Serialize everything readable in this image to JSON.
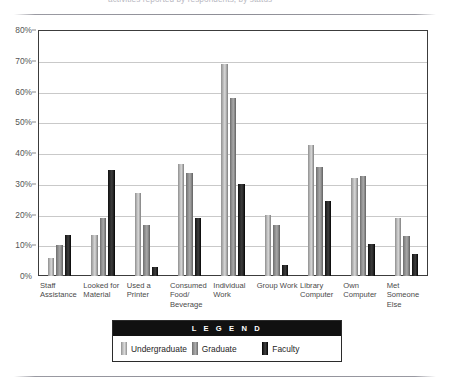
{
  "caption": {
    "text": "activities reported by respondents, by status"
  },
  "legend": {
    "title": "L E G E N D",
    "entries": [
      {
        "label": "Undergraduate",
        "key": "undergrad",
        "color": "#bdbdbd",
        "swatch_icon": "legend-swatch-undergraduate"
      },
      {
        "label": "Graduate",
        "key": "graduate",
        "color": "#949494",
        "swatch_icon": "legend-swatch-graduate"
      },
      {
        "label": "Faculty",
        "key": "faculty",
        "color": "#111111",
        "swatch_icon": "legend-swatch-faculty"
      }
    ]
  },
  "chart_data": {
    "type": "bar",
    "title": "",
    "xlabel": "",
    "ylabel": "",
    "ylim": [
      0,
      80
    ],
    "ytick_step": 10,
    "ytick_labels": [
      "0%",
      "10%",
      "20%",
      "30%",
      "40%",
      "50%",
      "60%",
      "70%",
      "80%"
    ],
    "grid": true,
    "legend_position": "bottom",
    "value_unit": "%",
    "categories": [
      "Staff Assistance",
      "Looked for Material",
      "Used a Printer",
      "Consumed Food/ Beverage",
      "Individual Work",
      "Group Work",
      "Library Computer",
      "Own Computer",
      "Met Someone Else"
    ],
    "series": [
      {
        "name": "Undergraduate",
        "color": "#bdbdbd",
        "values": [
          6,
          13.5,
          27,
          36.5,
          69,
          20,
          42.5,
          32,
          19
        ]
      },
      {
        "name": "Graduate",
        "color": "#949494",
        "values": [
          10,
          19,
          16.5,
          33.5,
          58,
          16.5,
          35.5,
          32.5,
          13
        ]
      },
      {
        "name": "Faculty",
        "color": "#111111",
        "values": [
          13.5,
          34.5,
          3,
          19,
          30,
          3.5,
          24.5,
          10.5,
          7
        ]
      }
    ]
  }
}
